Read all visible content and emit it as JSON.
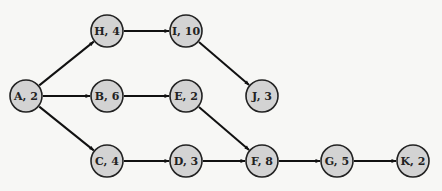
{
  "diagram": {
    "type": "activity-on-node network",
    "nodes": [
      {
        "id": "A",
        "label": "A, 2",
        "duration": 2,
        "x": 26,
        "y": 96
      },
      {
        "id": "H",
        "label": "H, 4",
        "duration": 4,
        "x": 107,
        "y": 31
      },
      {
        "id": "B",
        "label": "B, 6",
        "duration": 6,
        "x": 107,
        "y": 96
      },
      {
        "id": "C",
        "label": "C, 4",
        "duration": 4,
        "x": 107,
        "y": 161
      },
      {
        "id": "I",
        "label": "I, 10",
        "duration": 10,
        "x": 186,
        "y": 31
      },
      {
        "id": "E",
        "label": "E, 2",
        "duration": 2,
        "x": 186,
        "y": 96
      },
      {
        "id": "D",
        "label": "D, 3",
        "duration": 3,
        "x": 186,
        "y": 161
      },
      {
        "id": "J",
        "label": "J, 3",
        "duration": 3,
        "x": 262,
        "y": 96
      },
      {
        "id": "F",
        "label": "F, 8",
        "duration": 8,
        "x": 262,
        "y": 161
      },
      {
        "id": "G",
        "label": "G, 5",
        "duration": 5,
        "x": 337,
        "y": 161
      },
      {
        "id": "K",
        "label": "K, 2",
        "duration": 2,
        "x": 413,
        "y": 161
      }
    ],
    "edges": [
      {
        "from": "A",
        "to": "H"
      },
      {
        "from": "A",
        "to": "B"
      },
      {
        "from": "A",
        "to": "C"
      },
      {
        "from": "H",
        "to": "I"
      },
      {
        "from": "I",
        "to": "J"
      },
      {
        "from": "B",
        "to": "E"
      },
      {
        "from": "E",
        "to": "F"
      },
      {
        "from": "C",
        "to": "D"
      },
      {
        "from": "D",
        "to": "F"
      },
      {
        "from": "F",
        "to": "G"
      },
      {
        "from": "G",
        "to": "K"
      }
    ],
    "node_radius": 16,
    "colors": {
      "node_fill": "#d3d3d3",
      "node_stroke": "#222222",
      "edge": "#111111",
      "background": "#f7f7f5"
    }
  }
}
